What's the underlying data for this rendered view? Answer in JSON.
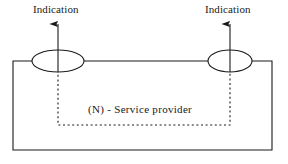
{
  "diagram": {
    "type": "block-diagram",
    "colors": {
      "stroke": "#1a1a1a",
      "background": "#ffffff",
      "text": "#1a1a1a"
    },
    "labels": {
      "indication_left": "Indication",
      "indication_right": "Indication",
      "service_provider": "(N) - Service  provider"
    },
    "shapes": {
      "outer_box": {
        "x": 13,
        "y": 61,
        "width": 259,
        "height": 89,
        "style": "solid"
      },
      "inner_box": {
        "x": 58,
        "y": 61,
        "width": 172,
        "height": 64,
        "style": "dotted",
        "open_top": true
      },
      "service_access_point_left": {
        "cx": 58,
        "cy": 61,
        "rx": 26,
        "ry": 11,
        "style": "ellipse"
      },
      "service_access_point_right": {
        "cx": 230,
        "cy": 61,
        "rx": 22,
        "ry": 11,
        "style": "ellipse"
      },
      "arrow_left": {
        "x": 58,
        "y_from": 72,
        "y_to": 21,
        "direction": "up"
      },
      "arrow_right": {
        "x": 230,
        "y_from": 72,
        "y_to": 21,
        "direction": "up"
      }
    }
  }
}
